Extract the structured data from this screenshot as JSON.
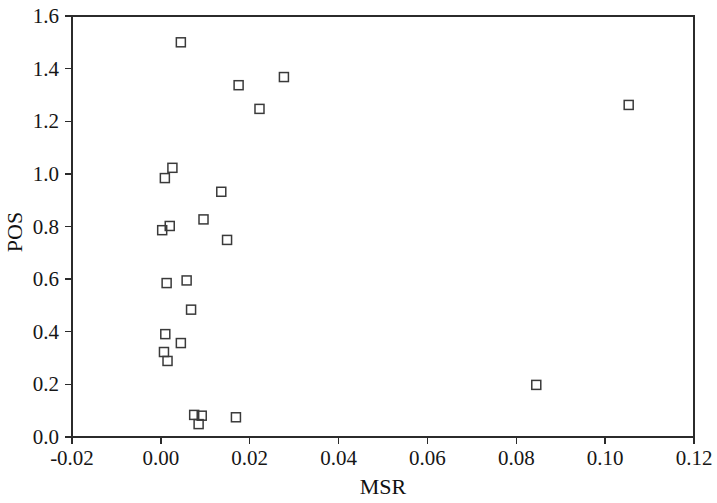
{
  "chart_data": {
    "type": "scatter",
    "title": "",
    "xlabel": "MSR",
    "ylabel": "POS",
    "xlim": [
      -0.02,
      0.12
    ],
    "ylim": [
      0.0,
      1.6
    ],
    "xticks": [
      -0.02,
      0.0,
      0.02,
      0.04,
      0.06,
      0.08,
      0.1,
      0.12
    ],
    "xtick_labels": [
      "-0.02",
      "0.00",
      "0.02",
      "0.04",
      "0.06",
      "0.08",
      "0.10",
      "0.12"
    ],
    "yticks": [
      0.0,
      0.2,
      0.4,
      0.6,
      0.8,
      1.0,
      1.2,
      1.4,
      1.6
    ],
    "ytick_labels": [
      "0.0",
      "0.2",
      "0.4",
      "0.6",
      "0.8",
      "1.0",
      "1.2",
      "1.4",
      "1.6"
    ],
    "grid": false,
    "legend": null,
    "marker": "open-square",
    "marker_color": "#3a3a3a",
    "series": [
      {
        "name": "POS vs MSR",
        "points": [
          {
            "x": 0.0045,
            "y": 1.5
          },
          {
            "x": 0.0175,
            "y": 1.337
          },
          {
            "x": 0.0277,
            "y": 1.368
          },
          {
            "x": 0.0222,
            "y": 1.247
          },
          {
            "x": 0.1053,
            "y": 1.262
          },
          {
            "x": 0.0026,
            "y": 1.023
          },
          {
            "x": 0.0009,
            "y": 0.984
          },
          {
            "x": 0.0136,
            "y": 0.932
          },
          {
            "x": 0.0096,
            "y": 0.827
          },
          {
            "x": 0.002,
            "y": 0.802
          },
          {
            "x": 0.0003,
            "y": 0.786
          },
          {
            "x": 0.0149,
            "y": 0.749
          },
          {
            "x": 0.0013,
            "y": 0.585
          },
          {
            "x": 0.0058,
            "y": 0.595
          },
          {
            "x": 0.0068,
            "y": 0.484
          },
          {
            "x": 0.001,
            "y": 0.391
          },
          {
            "x": 0.0045,
            "y": 0.357
          },
          {
            "x": 0.0007,
            "y": 0.323
          },
          {
            "x": 0.0015,
            "y": 0.289
          },
          {
            "x": 0.0845,
            "y": 0.198
          },
          {
            "x": 0.0092,
            "y": 0.081
          },
          {
            "x": 0.0169,
            "y": 0.075
          },
          {
            "x": 0.0075,
            "y": 0.084
          },
          {
            "x": 0.0085,
            "y": 0.049
          }
        ]
      }
    ]
  },
  "axes": {
    "x_title": "MSR",
    "y_title": "POS"
  }
}
